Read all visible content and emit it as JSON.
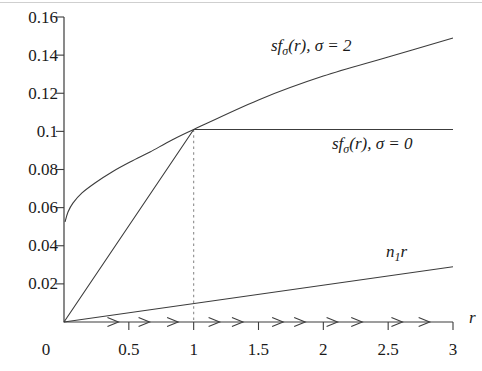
{
  "figure": {
    "origin_label": "0",
    "x_axis_label": "r",
    "x_ticks": [
      {
        "v": 0.5,
        "label": "0.5"
      },
      {
        "v": 1,
        "label": "1"
      },
      {
        "v": 1.5,
        "label": "1.5"
      },
      {
        "v": 2,
        "label": "2"
      },
      {
        "v": 2.5,
        "label": "2.5"
      },
      {
        "v": 3,
        "label": "3"
      }
    ],
    "y_ticks": [
      {
        "v": 0.02,
        "label": "0.02"
      },
      {
        "v": 0.04,
        "label": "0.04"
      },
      {
        "v": 0.06,
        "label": "0.06"
      },
      {
        "v": 0.08,
        "label": "0.08"
      },
      {
        "v": 0.1,
        "label": "0.1"
      },
      {
        "v": 0.12,
        "label": "0.12"
      },
      {
        "v": 0.14,
        "label": "0.14"
      },
      {
        "v": 0.16,
        "label": "0.16"
      }
    ],
    "annotations": {
      "sigma2": {
        "base": "sf",
        "sub": "σ",
        "rest": "(r), σ = 2"
      },
      "sigma0": {
        "base": "sf",
        "sub": "σ",
        "rest": "(r), σ = 0"
      },
      "n1r": {
        "base": "n",
        "sub": "1",
        "rest": "r"
      }
    },
    "colors": {
      "line": "#3c3c3c",
      "dashed": "#8c8c8c",
      "text": "#1a1a1a"
    }
  },
  "chart_data": {
    "type": "line",
    "title": "",
    "xlabel": "r",
    "ylabel": "",
    "xlim": [
      0,
      3
    ],
    "ylim": [
      0,
      0.16
    ],
    "grid": false,
    "legend_position": "labels drawn beside curves inside plot",
    "series": [
      {
        "name": "sf_sigma(r), sigma = 2",
        "smooth": true,
        "points": [
          [
            0.008,
            0.0525
          ],
          [
            0.031,
            0.0577
          ],
          [
            0.069,
            0.0624
          ],
          [
            0.139,
            0.0677
          ],
          [
            0.239,
            0.0729
          ],
          [
            0.37,
            0.0787
          ],
          [
            0.509,
            0.0839
          ],
          [
            0.663,
            0.0892
          ],
          [
            0.833,
            0.0955
          ],
          [
            1.0,
            0.101
          ],
          [
            1.5,
            0.1165
          ],
          [
            2.0,
            0.129
          ],
          [
            2.5,
            0.139
          ],
          [
            3.0,
            0.149
          ]
        ]
      },
      {
        "name": "sf_sigma(r), sigma = 0",
        "smooth": false,
        "points": [
          [
            0,
            0
          ],
          [
            1,
            0.101
          ],
          [
            3,
            0.101
          ]
        ]
      },
      {
        "name": "n1 * r",
        "smooth": false,
        "points": [
          [
            0,
            0
          ],
          [
            3,
            0.029
          ]
        ]
      }
    ],
    "guide_line": {
      "style": "dashed",
      "x": 1,
      "y_from": 0,
      "y_to": 0.101
    },
    "axis_arrows_r": [
      0.42,
      0.66,
      0.88,
      1.2,
      1.38,
      1.69,
      1.86,
      2.11,
      2.3,
      2.61,
      2.82
    ]
  }
}
